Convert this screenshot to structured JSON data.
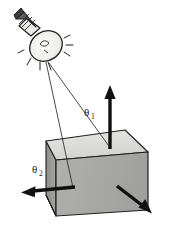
{
  "figure": {
    "background_color": "#ffffff",
    "width": 180,
    "height": 243
  },
  "labels": [
    {
      "id": "theta1",
      "symbol": "θ",
      "subscript": "1",
      "x": 84,
      "y": 116,
      "meaning": "incidence-angle-label"
    },
    {
      "id": "theta2",
      "symbol": "θ",
      "subscript": "2",
      "x": 33,
      "y": 173,
      "meaning": "refraction-angle-label"
    }
  ],
  "light_source": {
    "name": "light-bulb",
    "center_x": 47,
    "center_y": 45,
    "glass_fill": "#f2f1ee",
    "outline_color": "#1f1f1f",
    "base_fill": "#6e6e6e",
    "spark_count": 7
  },
  "cube": {
    "name": "cube",
    "top_face_fill": "#d9d9d9",
    "left_face_fill": "#9a9a9a",
    "front_face_fill": "#a8a8a8",
    "edge_color": "#1f1f1f",
    "vertices": {
      "top_back_left": "55,130",
      "top_back_right": "136,122",
      "top_front_right": "148,152",
      "top_front_left": "56,160",
      "bottom_front_left": "56,216",
      "bottom_front_right": "148,210",
      "bottom_back_left": "46,195"
    }
  },
  "rays": [
    {
      "name": "incident-ray-to-normal",
      "from": "49,63",
      "to": "111,148",
      "stroke": "#2a2a2a",
      "width": 0.9
    },
    {
      "name": "incident-ray-to-left-vector",
      "from": "47,63",
      "to": "73,187",
      "stroke": "#2a2a2a",
      "width": 0.9
    }
  ],
  "arrows": [
    {
      "name": "normal-vector-arrow",
      "direction": "up",
      "tail": "110,148",
      "head": "110,86",
      "color": "#111111"
    },
    {
      "name": "reflected-vector-arrow-left",
      "direction": "left",
      "tail": "74,187",
      "head": "22,192",
      "color": "#111111"
    },
    {
      "name": "transmitted-vector-arrow-down-right",
      "direction": "down-right",
      "tail": "117,186",
      "head": "151,213",
      "color": "#111111"
    }
  ],
  "colors": {
    "ink": "#1f1f1f",
    "light_gray": "#d9d9d9",
    "mid_gray": "#a8a8a8",
    "dark_gray": "#9a9a9a",
    "page": "#ffffff"
  }
}
